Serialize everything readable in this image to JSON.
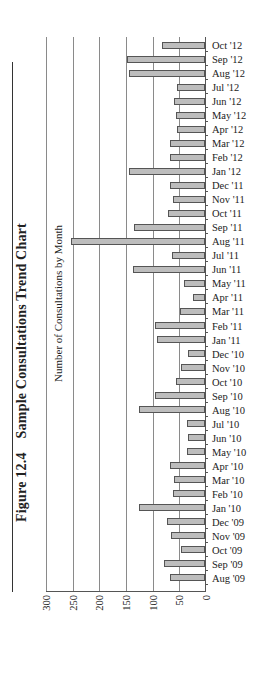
{
  "figure": {
    "number": "Figure 12.4",
    "title": "Sample Consultations Trend Chart",
    "subtitle": "Number of Consultations by Month"
  },
  "chart_data": {
    "type": "bar",
    "title": "Sample Consultations Trend Chart",
    "subtitle": "Number of Consultations by Month",
    "xlabel": "",
    "ylabel": "",
    "ylim": [
      0,
      300
    ],
    "yticks": [
      0,
      50,
      100,
      150,
      200,
      250,
      300
    ],
    "grid": true,
    "legend": "none",
    "orientation_note": "page rotated 90 degrees counterclockwise",
    "categories": [
      "Aug '09",
      "Sep '09",
      "Oct '09",
      "Nov '09",
      "Dec '09",
      "Jan '10",
      "Feb '10",
      "Mar '10",
      "Apr '10",
      "May '10",
      "Jun '10",
      "Jul '10",
      "Aug '10",
      "Sep '10",
      "Oct '10",
      "Nov '10",
      "Dec '10",
      "Jan '11",
      "Feb '11",
      "Mar '11",
      "Apr '11",
      "May '11",
      "Jun '11",
      "Jul '11",
      "Aug '11",
      "Sep '11",
      "Oct '11",
      "Nov '11",
      "Dec '11",
      "Jan '12",
      "Feb '12",
      "Mar '12",
      "Apr '12",
      "May '12",
      "Jun '12",
      "Jul '12",
      "Aug '12",
      "Sep '12",
      "Oct '12"
    ],
    "values": [
      66,
      77,
      45,
      64,
      71,
      124,
      60,
      58,
      66,
      34,
      32,
      34,
      124,
      94,
      54,
      45,
      32,
      90,
      94,
      47,
      23,
      40,
      135,
      62,
      251,
      133,
      70,
      60,
      66,
      143,
      66,
      66,
      52,
      55,
      58,
      52,
      143,
      147,
      80
    ],
    "bar_color": "#bdbdbd",
    "bar_edge_color": "#555555"
  }
}
